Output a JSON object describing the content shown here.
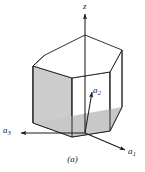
{
  "figure": {
    "caption": "(a)",
    "background_color": "#ffffff",
    "line_color": "#1a1a1a",
    "face_fill_color": "#d2d2d2",
    "face_fill_color_dark": "#c4c4c4",
    "dashed_line_color": "#555555"
  },
  "axes": [
    {
      "id": "z",
      "label": "z",
      "subscript": "",
      "direction": "up",
      "arrow_tip": {
        "x": 85,
        "y": 12
      },
      "arrow_tail": {
        "x": 85,
        "y": 133
      }
    },
    {
      "id": "a1",
      "label": "a",
      "subscript": "1",
      "direction": "down-right",
      "arrow_tip": {
        "x": 126,
        "y": 150
      },
      "arrow_tail": {
        "x": 85,
        "y": 133
      }
    },
    {
      "id": "a2",
      "label": "a",
      "subscript": "2",
      "direction": "up-right",
      "arrow_tip": {
        "x": 92,
        "y": 88
      },
      "arrow_tail": {
        "x": 85,
        "y": 133
      }
    },
    {
      "id": "a3",
      "label": "a",
      "subscript": "3",
      "direction": "left",
      "arrow_tip": {
        "x": 19,
        "y": 133
      },
      "arrow_tail": {
        "x": 85,
        "y": 133
      }
    }
  ],
  "geometry": {
    "top_face_vertices": [
      {
        "x": 45,
        "y": 55
      },
      {
        "x": 85,
        "y": 35
      },
      {
        "x": 122,
        "y": 50
      },
      {
        "x": 110,
        "y": 72
      },
      {
        "x": 72,
        "y": 78
      },
      {
        "x": 33,
        "y": 66
      }
    ],
    "bottom_face_vertices": [
      {
        "x": 45,
        "y": 110
      },
      {
        "x": 85,
        "y": 92
      },
      {
        "x": 122,
        "y": 107
      },
      {
        "x": 110,
        "y": 131
      },
      {
        "x": 72,
        "y": 137
      },
      {
        "x": 33,
        "y": 123
      }
    ],
    "prism_height": 55,
    "shaded_faces": [
      "front-left-vertical",
      "front-center-vertical",
      "bottom-left-sliver"
    ]
  }
}
